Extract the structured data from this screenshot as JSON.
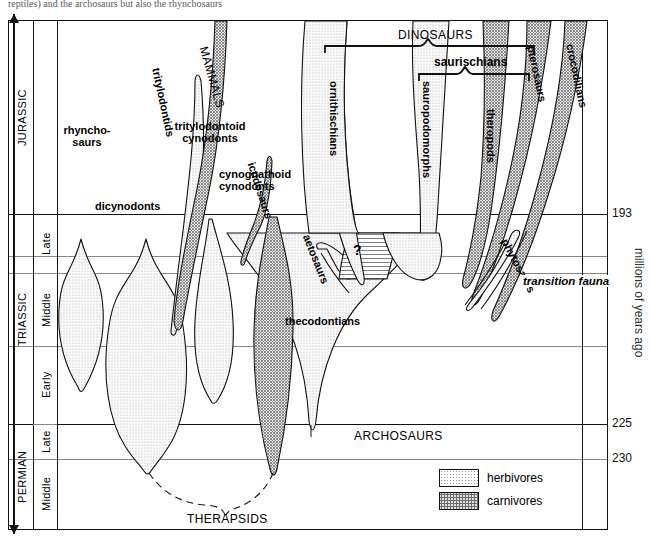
{
  "caption": "reptiles) and the archosaurs but also the rhynchosaurs",
  "axes": {
    "y_title": "millions of years ago",
    "y_ticks": [
      {
        "value": "193",
        "y": 213
      },
      {
        "value": "225",
        "y": 423
      },
      {
        "value": "230",
        "y": 458
      }
    ],
    "periods": [
      {
        "name": "JURASSIC",
        "top": 0,
        "height": 193
      },
      {
        "name": "TRIASSIC",
        "top": 193,
        "height": 230
      },
      {
        "name": "PERMIAN",
        "top": 423,
        "height": 85
      }
    ],
    "epochs": [
      {
        "name": "Late",
        "top": 193,
        "height": 80
      },
      {
        "name": "Middle",
        "top": 273,
        "height": 75
      },
      {
        "name": "Early",
        "top": 348,
        "height": 75
      },
      {
        "name": "Late",
        "top": 423,
        "height": 40
      },
      {
        "name": "Middle",
        "top": 463,
        "height": 45
      }
    ],
    "gridlines_minor_y": [
      255,
      272,
      345,
      402,
      458,
      272,
      291
    ],
    "gridlines_major_y": [
      213,
      423
    ]
  },
  "brackets": [
    {
      "label": "DINOSAURS",
      "x1": 316,
      "x2": 525,
      "y": 38
    },
    {
      "label": "saurischians",
      "x1": 410,
      "x2": 520,
      "y": 67
    }
  ],
  "lineages": [
    {
      "name": "rhyncho-saurs",
      "diet": "herbivores",
      "label_lines": [
        "rhyncho-",
        "saurs"
      ]
    },
    {
      "name": "dicynodonts",
      "diet": "herbivores",
      "label_lines": [
        "dicynodonts"
      ]
    },
    {
      "name": "tritylodontoid cynodonts",
      "diet": "herbivores",
      "label_lines": [
        "tritylodontoid",
        "cynodonts"
      ]
    },
    {
      "name": "cynognathoid cynodonts",
      "diet": "carnivores",
      "label_lines": [
        "cynognathoid",
        "cynodonts"
      ]
    },
    {
      "name": "tritylodontids",
      "diet": "herbivores",
      "label_lines": [
        "tritylodontids"
      ]
    },
    {
      "name": "MAMMALS",
      "diet": "carnivores",
      "label_lines": [
        "MAMMALS"
      ]
    },
    {
      "name": "ictidosaurs",
      "diet": "carnivores",
      "label_lines": [
        "ictidosaurs"
      ]
    },
    {
      "name": "aetosaurs",
      "diet": "herbivores",
      "label_lines": [
        "aetosaurs"
      ]
    },
    {
      "name": "ornithischians",
      "diet": "herbivores",
      "label_lines": [
        "ornithischians"
      ]
    },
    {
      "name": "sauropodomorphs",
      "diet": "herbivores",
      "label_lines": [
        "sauropodomorphs"
      ]
    },
    {
      "name": "theropods",
      "diet": "carnivores",
      "label_lines": [
        "theropods"
      ]
    },
    {
      "name": "pterosaurs",
      "diet": "carnivores",
      "label_lines": [
        "pterosaurs"
      ]
    },
    {
      "name": "crocodilians",
      "diet": "carnivores",
      "label_lines": [
        "crocodilians"
      ]
    },
    {
      "name": "phytosaurs",
      "diet": "carnivores",
      "label_lines": [
        "phytosaurs"
      ]
    },
    {
      "name": "thecodontians",
      "diet": "herbivores",
      "label_lines": [
        "thecodontians"
      ]
    }
  ],
  "annotations": {
    "question_mark": "?",
    "transition_fauna": "transition fauna",
    "archosaurs": "ARCHOSAURS",
    "therapsids": "THERAPSIDS"
  },
  "legend": {
    "title": "",
    "items": [
      {
        "label": "herbivores",
        "pattern": "fine-stipple"
      },
      {
        "label": "carnivores",
        "pattern": "coarse-stipple"
      }
    ]
  }
}
